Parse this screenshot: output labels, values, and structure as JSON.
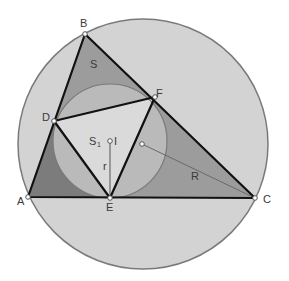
{
  "colors": {
    "background": "#ffffff",
    "circumcircle_fill": "#d3d3d3",
    "circumcircle_stroke": "#7a7a7a",
    "triangle_fill": "#9c9c9c",
    "corner_dark_fill": "#7c7c7c",
    "incircle_fill": "#bababa",
    "incircle_stroke": "#7a7a7a",
    "contact_triangle_fill": "#dadada",
    "edge_stroke": "#111111",
    "thin_line": "#6a6a6a",
    "point_fill": "#ffffff",
    "point_stroke": "#555555"
  },
  "circumcircle": {
    "cx": 143,
    "cy": 144,
    "r": 125,
    "label": "R"
  },
  "incircle": {
    "cx": 110,
    "cy": 141,
    "r": 57,
    "label": "r"
  },
  "points": {
    "A": {
      "x": 28,
      "y": 197,
      "label": "A"
    },
    "B": {
      "x": 85,
      "y": 34,
      "label": "B"
    },
    "C": {
      "x": 255,
      "y": 198,
      "label": "C"
    },
    "D": {
      "x": 54,
      "y": 121,
      "label": "D"
    },
    "E": {
      "x": 110,
      "y": 198,
      "label": "E"
    },
    "F": {
      "x": 155,
      "y": 97,
      "label": "F"
    },
    "I": {
      "x": 110,
      "y": 141,
      "label": "I"
    },
    "O": {
      "x": 142,
      "y": 144,
      "label": ""
    }
  },
  "region_labels": {
    "S": "S",
    "S1_main": "S",
    "S1_sub": "1"
  },
  "segment_labels": {
    "R": "R",
    "r": "r"
  }
}
